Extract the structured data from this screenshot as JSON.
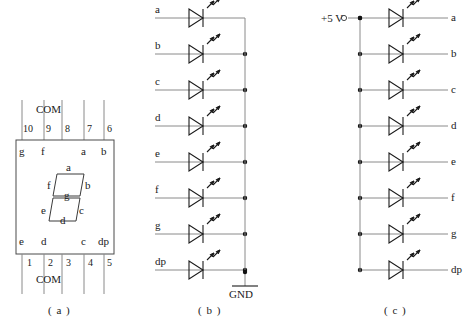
{
  "figure": {
    "parts": [
      {
        "id": "a",
        "caption": "( a )",
        "title": "seven-segment-display-package"
      },
      {
        "id": "b",
        "caption": "( b )",
        "title": "common-cathode-led-array"
      },
      {
        "id": "c",
        "caption": "( c )",
        "title": "common-anode-led-array"
      }
    ]
  },
  "part_a": {
    "com_top_label": "COM",
    "com_bottom_label": "COM",
    "top_pins": [
      "10",
      "9",
      "8",
      "7",
      "6"
    ],
    "bottom_pins": [
      "1",
      "2",
      "3",
      "4",
      "5"
    ],
    "top_segments": [
      "g",
      "f",
      "a",
      "b"
    ],
    "bottom_segments": [
      "e",
      "d",
      "c",
      "dp"
    ],
    "digit_segments": {
      "a": "a",
      "b": "b",
      "c": "c",
      "d": "d",
      "e": "e",
      "f": "f",
      "g": "g"
    }
  },
  "part_b": {
    "rows": [
      "a",
      "b",
      "c",
      "d",
      "e",
      "f",
      "g",
      "dp"
    ],
    "ground_label": "GND"
  },
  "part_c": {
    "supply_label": "+5 V",
    "rows": [
      "a",
      "b",
      "c",
      "d",
      "e",
      "f",
      "g",
      "dp"
    ]
  },
  "colors": {
    "wire": "#8a8a8a",
    "symbol": "#1a1a1a",
    "box": "#4a4a4a",
    "background": "#ffffff"
  }
}
